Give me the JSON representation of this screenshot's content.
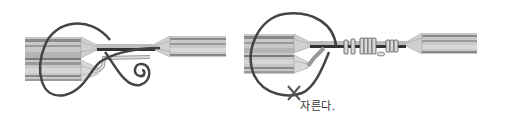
{
  "figures": [
    {
      "id": "left",
      "description": "wire splice: tail wire looped around joint with spiral end",
      "colors": {
        "cable_light": "#c9c9c9",
        "cable_mid": "#a8a8a8",
        "cable_dark": "#6e6e6e",
        "wire": "#444444"
      }
    },
    {
      "id": "right",
      "description": "wire splice wrapped with binding coils; loop to be cut",
      "annotation": "자른다.",
      "colors": {
        "cable_light": "#c9c9c9",
        "cable_mid": "#a8a8a8",
        "cable_dark": "#6e6e6e",
        "wire": "#444444",
        "cut_mark": "#555555"
      }
    }
  ]
}
